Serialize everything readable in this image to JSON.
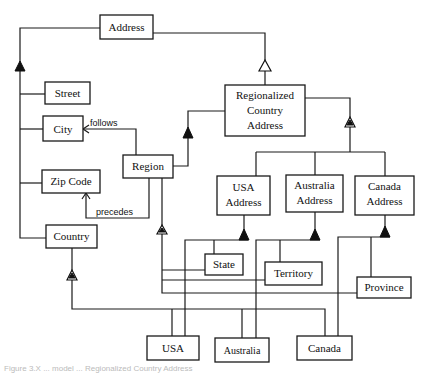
{
  "diagram": {
    "classes": {
      "address": "Address",
      "street": "Street",
      "city": "City",
      "zip_code": "Zip Code",
      "country": "Country",
      "region": "Region",
      "regionalized_line1": "Regionalized",
      "regionalized_line2": "Country",
      "regionalized_line3": "Address",
      "usa_address_line1": "USA",
      "usa_address_line2": "Address",
      "australia_address_line1": "Australia",
      "australia_address_line2": "Address",
      "canada_address_line1": "Canada",
      "canada_address_line2": "Address",
      "state": "State",
      "territory": "Territory",
      "province": "Province",
      "usa": "USA",
      "australia": "Australia",
      "canada": "Canada"
    },
    "relations": {
      "follows": "follows",
      "precedes": "precedes"
    },
    "caption": "Figure 3.X  ...  model ... Regionalized Country Address"
  }
}
